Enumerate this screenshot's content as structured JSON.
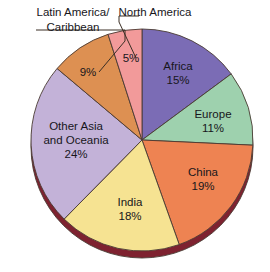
{
  "chart_data": {
    "type": "pie",
    "title": "",
    "subtitle": "",
    "xlabel": "",
    "ylabel": "",
    "legend_position": "none",
    "grid": false,
    "start_angle_deg": 0,
    "direction": "clockwise",
    "total_percent": 101,
    "categories": [
      "Africa",
      "Europe",
      "China",
      "India",
      "Other Asia and Oceania",
      "Latin America/Caribbean",
      "North America"
    ],
    "values": [
      15,
      11,
      19,
      18,
      24,
      9,
      5
    ],
    "colors": [
      "#7b6cb5",
      "#9ed1ae",
      "#ee8352",
      "#f6e392",
      "#c3b2d8",
      "#dd9052",
      "#f29a9a"
    ],
    "slices": [
      {
        "name": "africa",
        "label": "Africa",
        "percent_label": "15%",
        "value": 15,
        "color": "#7b6cb5",
        "label_style": "inside",
        "label_x": 178,
        "label_y": 70,
        "pct_x": 178,
        "pct_y": 84
      },
      {
        "name": "europe",
        "label": "Europe",
        "percent_label": "11%",
        "value": 11,
        "color": "#9ed1ae",
        "label_style": "inside",
        "label_x": 213,
        "label_y": 118,
        "pct_x": 213,
        "pct_y": 132
      },
      {
        "name": "china",
        "label": "China",
        "percent_label": "19%",
        "value": 19,
        "color": "#ee8352",
        "label_style": "inside",
        "label_x": 203,
        "label_y": 176,
        "pct_x": 203,
        "pct_y": 190
      },
      {
        "name": "india",
        "label": "India",
        "percent_label": "18%",
        "value": 18,
        "color": "#f6e392",
        "label_style": "inside",
        "label_x": 130,
        "label_y": 206,
        "pct_x": 130,
        "pct_y": 220
      },
      {
        "name": "other-asia-and-oceania",
        "label": "Other Asia",
        "label_line2": "and Oceania",
        "percent_label": "24%",
        "value": 24,
        "color": "#c3b2d8",
        "label_style": "inside",
        "label_x": 76,
        "label_y": 130,
        "label2_x": 76,
        "label2_y": 144,
        "pct_x": 76,
        "pct_y": 158
      },
      {
        "name": "latin-america-caribbean",
        "label": "Latin America/",
        "label_line2": "Caribbean",
        "percent_label": "9%",
        "value": 9,
        "color": "#dd9052",
        "label_style": "callout",
        "label_x": 73,
        "label_y": 16,
        "label2_x": 73,
        "label2_y": 31,
        "pct_x": 88,
        "pct_y": 76
      },
      {
        "name": "north-america",
        "label": "North America",
        "percent_label": "5%",
        "value": 5,
        "color": "#f29a9a",
        "label_style": "callout",
        "label_x": 155,
        "label_y": 16,
        "pct_x": 131,
        "pct_y": 62
      }
    ],
    "geometry": {
      "center_x": 142,
      "center_y": 140,
      "radius": 111,
      "depth_offset_y": 7,
      "edge_color": "#7e2230",
      "outline_color": "#4a3b33"
    },
    "callouts": [
      {
        "name": "latin-america-leader",
        "points": "36,30 125,30 125,41 99,72"
      },
      {
        "name": "north-america-leader",
        "points": "139,16 119,16 119,22 136,58"
      }
    ],
    "background_color": "#ffffff"
  }
}
